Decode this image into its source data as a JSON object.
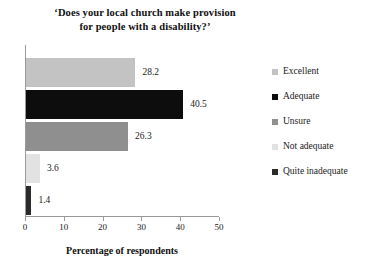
{
  "chart_data": {
    "type": "bar",
    "orientation": "horizontal",
    "title": "‘Does your local church make provision\nfor people with a disability?’",
    "xlabel": "Percentage of respondents",
    "ylabel": "",
    "xlim": [
      0,
      50
    ],
    "xticks": [
      0,
      10,
      20,
      30,
      40,
      50
    ],
    "xtick_labels": [
      "0",
      "10",
      "20",
      "30",
      "40",
      "50"
    ],
    "grid": false,
    "legend_position": "right",
    "categories": [
      "Excellent",
      "Adequate",
      "Unsure",
      "Not adequate",
      "Quite inadequate"
    ],
    "values": [
      28.2,
      40.5,
      26.3,
      3.6,
      1.4
    ],
    "value_labels": [
      "28.2",
      "40.5",
      "26.3",
      "3.6",
      "1.4"
    ],
    "colors": [
      "#c3c3c3",
      "#0d0d0d",
      "#8f8f8f",
      "#e2e2e2",
      "#2b2b2b"
    ],
    "bars": [
      {
        "label": "Excellent",
        "value": 28.2,
        "value_label": "28.2",
        "color": "#c3c3c3"
      },
      {
        "label": "Adequate",
        "value": 40.5,
        "value_label": "40.5",
        "color": "#0d0d0d"
      },
      {
        "label": "Unsure",
        "value": 26.3,
        "value_label": "26.3",
        "color": "#8f8f8f"
      },
      {
        "label": "Not adequate",
        "value": 3.6,
        "value_label": "3.6",
        "color": "#e2e2e2"
      },
      {
        "label": "Quite inadequate",
        "value": 1.4,
        "value_label": "1.4",
        "color": "#2b2b2b"
      }
    ],
    "legend": [
      {
        "label": "Excellent",
        "color": "#c3c3c3"
      },
      {
        "label": "Adequate",
        "color": "#0d0d0d"
      },
      {
        "label": "Unsure",
        "color": "#8f8f8f"
      },
      {
        "label": "Not adequate",
        "color": "#e2e2e2"
      },
      {
        "label": "Quite inadequate",
        "color": "#2b2b2b"
      }
    ]
  },
  "axis": {
    "line_color": "#9a9a9a"
  }
}
